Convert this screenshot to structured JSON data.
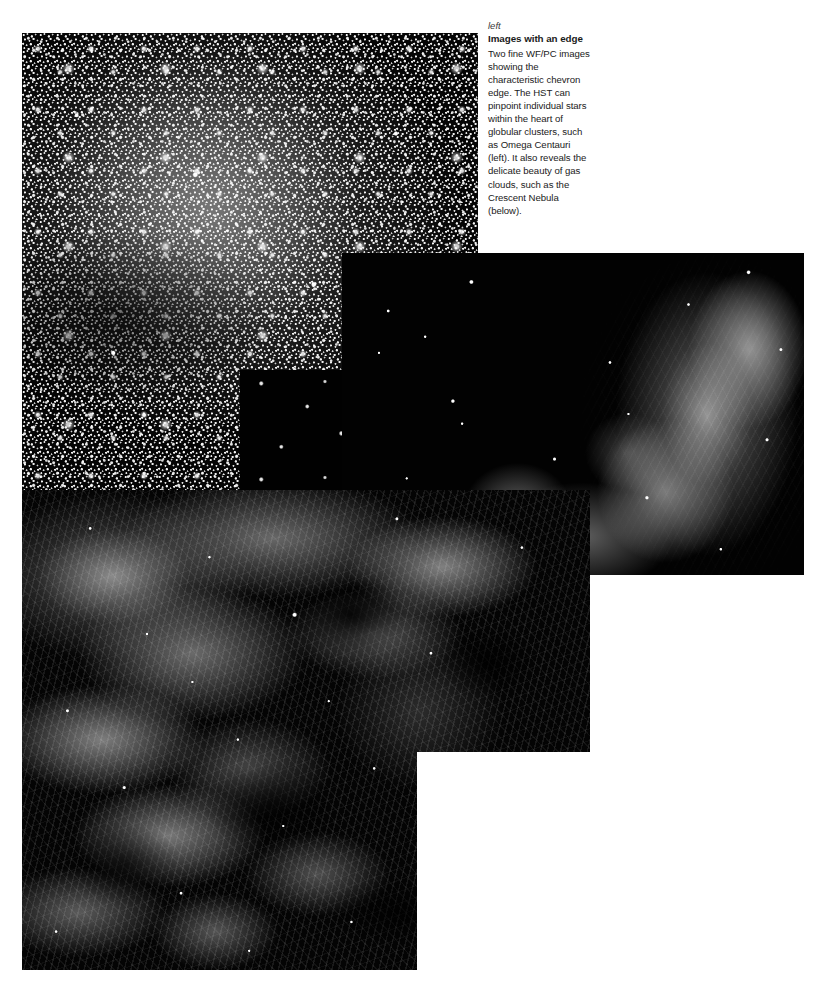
{
  "page": {
    "width": 824,
    "height": 988,
    "background_color": "#ffffff",
    "text_color": "#1a1a1a"
  },
  "caption": {
    "kicker": "left",
    "headline": "Images with an edge",
    "body": "Two fine WF/PC images showing the characteristic chevron edge. The HST can pinpoint individual stars within the heart of globular clusters, such as Omega Centauri (left). It also reveals the delicate beauty of gas clouds, such as the Crescent Nebula (below)."
  },
  "plates": [
    {
      "id": "globular-cluster",
      "subject": "Omega Centauri globular cluster",
      "description": "Dense field of resolved stars filling the frame",
      "x": 22,
      "y": 33,
      "width": 456,
      "height": 457,
      "background_color": "#050505"
    },
    {
      "id": "mid-dark-panel",
      "subject": "Dark sky sliver",
      "description": "Sparse dark starfield overlapping the cluster plate",
      "x": 240,
      "y": 370,
      "width": 350,
      "height": 205,
      "background_color": "#010101"
    },
    {
      "id": "crescent-nebula-right",
      "subject": "Crescent Nebula detail",
      "description": "Wispy filamentary gas cloud on the right with scattered stars",
      "x": 342,
      "y": 253,
      "width": 462,
      "height": 322,
      "background_color": "#020202"
    },
    {
      "id": "crescent-nebula-main",
      "subject": "Crescent Nebula (below)",
      "description": "Large stepped chevron-edged plate of glowing filamentary gas",
      "x": 22,
      "y": 490,
      "width": 568,
      "height": 480,
      "step_x": 395,
      "step_y": 262,
      "background_color": "#040404"
    }
  ]
}
